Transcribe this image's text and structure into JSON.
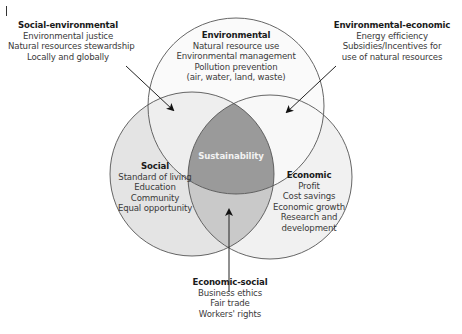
{
  "diagram": {
    "type": "venn",
    "colors": {
      "background": "#ffffff",
      "social_fill": "#e4e4e4",
      "economic_fill": "#f1f1f1",
      "environmental_fill": "#f6f6f6",
      "social_economic_overlap": "#c9c9c9",
      "center_fill": "#9a9a9a",
      "outline": "#555555",
      "center_text": "#f2f2f2"
    },
    "center": {
      "label": "Sustainability"
    },
    "circles": {
      "environmental": {
        "title": "Environmental",
        "items": [
          "Natural resource use",
          "Environmental management",
          "Pollution prevention",
          "(air, water, land, waste)"
        ]
      },
      "social": {
        "title": "Social",
        "items": [
          "Standard of living",
          "Education",
          "Community",
          "Equal opportunity"
        ]
      },
      "economic": {
        "title": "Economic",
        "items": [
          "Profit",
          "Cost savings",
          "Economic growth",
          "Research and",
          "development"
        ]
      }
    },
    "overlaps": {
      "social_environmental": {
        "title": "Social-environmental",
        "items": [
          "Environmental justice",
          "Natural resources stewardship",
          "Locally and globally"
        ]
      },
      "environmental_economic": {
        "title": "Environmental-economic",
        "items": [
          "Energy efficiency",
          "Subsidies/Incentives for",
          "use of natural resources"
        ]
      },
      "economic_social": {
        "title": "Economic-social",
        "items": [
          "Business ethics",
          "Fair trade",
          "Workers' rights"
        ]
      }
    }
  }
}
